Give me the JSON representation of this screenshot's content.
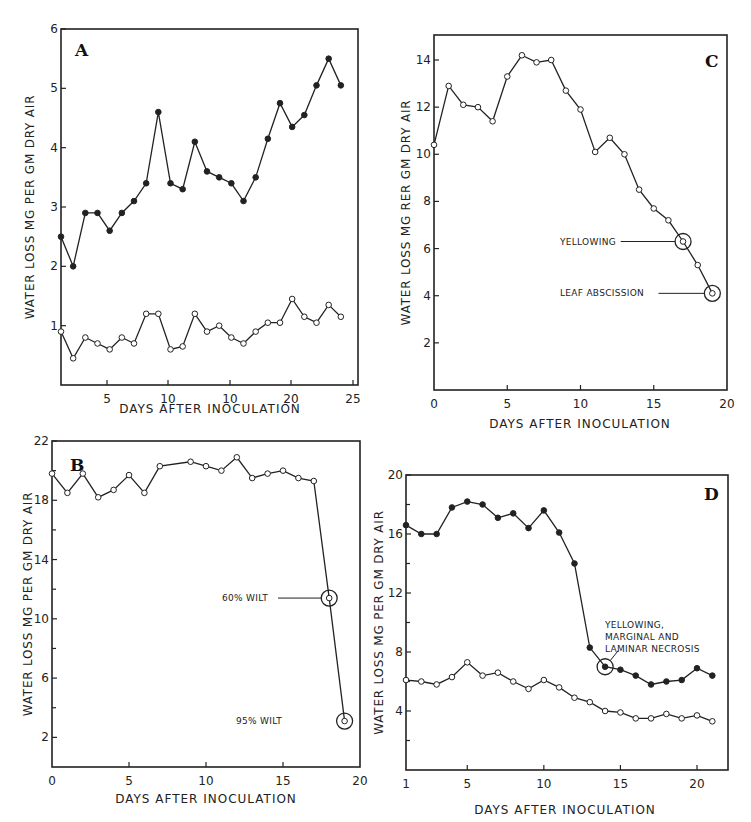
{
  "figure": {
    "panels": {
      "A": {
        "label": "A",
        "xlabel": "DAYS AFTER INOCULATION",
        "ylabel": "WATER LOSS MG PER GM DRY AIR",
        "xticks": [
          "5",
          "10",
          "10",
          "20",
          "25"
        ],
        "yticks": [
          "1",
          "2",
          "3",
          "4",
          "5",
          "6"
        ]
      },
      "B": {
        "label": "B",
        "xlabel": "DAYS AFTER INOCULATION",
        "ylabel": "WATER LOSS MG PER GM DRY AIR",
        "xticks": [
          "0",
          "5",
          "10",
          "15",
          "20"
        ],
        "yticks": [
          "2",
          "6",
          "10",
          "14",
          "18",
          "22"
        ],
        "annotations": [
          "60% WILT",
          "95% WILT"
        ]
      },
      "C": {
        "label": "C",
        "xlabel": "DAYS AFTER INOCULATION",
        "ylabel": "WATER LOSS MG RER GM DRY AIR",
        "xticks": [
          "0",
          "5",
          "10",
          "15",
          "20"
        ],
        "yticks": [
          "2",
          "4",
          "6",
          "8",
          "10",
          "12",
          "14"
        ],
        "annotations": [
          "YELLOWING",
          "LEAF ABSCISSION"
        ]
      },
      "D": {
        "label": "D",
        "xlabel": "DAYS AFTER INOCULATION",
        "ylabel": "WATER LOSS MG PER GM DRY AIR",
        "xticks": [
          "1",
          "5",
          "10",
          "15",
          "20"
        ],
        "yticks": [
          "4",
          "8",
          "12",
          "16",
          "20"
        ],
        "annotations": [
          "YELLOWING,",
          "MARGINAL AND",
          "LAMINAR NECROSIS"
        ]
      }
    }
  },
  "chart_data": [
    {
      "panel": "A",
      "type": "line",
      "title": "A",
      "xlabel": "DAYS AFTER INOCULATION",
      "ylabel": "WATER LOSS MG PER GM DRY AIR",
      "xlim": [
        1,
        25
      ],
      "ylim": [
        0,
        6
      ],
      "grid": false,
      "x_tick_labels": [
        "5",
        "10",
        "10",
        "20",
        "25"
      ],
      "series": [
        {
          "name": "inoculated (closed circles)",
          "marker": "filled",
          "x": [
            1,
            2,
            3,
            4,
            5,
            6,
            7,
            8,
            9,
            10,
            11,
            12,
            13,
            14,
            15,
            16,
            17,
            18,
            19,
            20,
            21,
            22,
            23,
            24
          ],
          "values": [
            2.5,
            2.0,
            2.9,
            2.9,
            2.6,
            2.9,
            3.1,
            3.4,
            4.6,
            3.4,
            3.3,
            4.1,
            3.6,
            3.5,
            3.4,
            3.1,
            3.5,
            4.15,
            4.75,
            4.35,
            4.55,
            5.05,
            5.5,
            5.05
          ]
        },
        {
          "name": "control (open circles)",
          "marker": "open",
          "x": [
            1,
            2,
            3,
            4,
            5,
            6,
            7,
            8,
            9,
            10,
            11,
            12,
            13,
            14,
            15,
            16,
            17,
            18,
            19,
            20,
            21,
            22,
            23,
            24
          ],
          "values": [
            0.9,
            0.45,
            0.8,
            0.7,
            0.6,
            0.8,
            0.7,
            1.2,
            1.2,
            0.6,
            0.65,
            1.2,
            0.9,
            1.0,
            0.8,
            0.7,
            0.9,
            1.05,
            1.05,
            1.45,
            1.15,
            1.05,
            1.35,
            1.15
          ]
        }
      ]
    },
    {
      "panel": "B",
      "type": "line",
      "title": "B",
      "xlabel": "DAYS AFTER INOCULATION",
      "ylabel": "WATER LOSS MG PER GM DRY AIR",
      "xlim": [
        0,
        20
      ],
      "ylim": [
        0,
        22
      ],
      "grid": false,
      "annotations": [
        {
          "text": "60% WILT",
          "x": 18,
          "y": 11.4
        },
        {
          "text": "95% WILT",
          "x": 19,
          "y": 3.1
        }
      ],
      "series": [
        {
          "name": "inoculated",
          "marker": "open",
          "x": [
            0,
            1,
            2,
            3,
            4,
            5,
            6,
            7,
            9,
            10,
            11,
            12,
            13,
            14,
            15,
            16,
            17,
            18,
            19
          ],
          "values": [
            19.8,
            18.5,
            19.8,
            18.2,
            18.7,
            19.7,
            18.5,
            20.3,
            20.6,
            20.3,
            20.0,
            20.9,
            19.5,
            19.8,
            20.0,
            19.5,
            19.3,
            11.4,
            3.1
          ]
        }
      ]
    },
    {
      "panel": "C",
      "type": "line",
      "title": "C",
      "xlabel": "DAYS AFTER INOCULATION",
      "ylabel": "WATER LOSS MG RER GM DRY AIR",
      "xlim": [
        0,
        20
      ],
      "ylim": [
        0,
        15
      ],
      "grid": false,
      "annotations": [
        {
          "text": "YELLOWING",
          "x": 17,
          "y": 6.3
        },
        {
          "text": "LEAF ABSCISSION",
          "x": 19,
          "y": 4.1
        }
      ],
      "series": [
        {
          "name": "inoculated",
          "marker": "open",
          "x": [
            0,
            1,
            2,
            3,
            4,
            5,
            6,
            7,
            8,
            9,
            10,
            11,
            12,
            13,
            14,
            15,
            16,
            17,
            18,
            19
          ],
          "values": [
            10.4,
            12.9,
            12.1,
            12.0,
            11.4,
            13.3,
            14.2,
            13.9,
            14.0,
            12.7,
            11.9,
            10.1,
            10.7,
            10.0,
            8.5,
            7.7,
            7.2,
            6.3,
            5.3,
            4.1
          ]
        }
      ]
    },
    {
      "panel": "D",
      "type": "line",
      "title": "D",
      "xlabel": "DAYS AFTER INOCULATION",
      "ylabel": "WATER LOSS MG PER GM DRY AIR",
      "xlim": [
        1,
        21.4
      ],
      "ylim": [
        0,
        20
      ],
      "grid": false,
      "annotations": [
        {
          "text": "YELLOWING, MARGINAL AND LAMINAR NECROSIS",
          "x": 14,
          "y": 7.0
        }
      ],
      "series": [
        {
          "name": "inoculated (closed circles)",
          "marker": "filled",
          "x": [
            1,
            2,
            3,
            4,
            5,
            6,
            7,
            8,
            9,
            10,
            11,
            12,
            13,
            14,
            15,
            16,
            17,
            18,
            19,
            20,
            21
          ],
          "values": [
            16.6,
            16.0,
            16.0,
            17.8,
            18.2,
            18.0,
            17.1,
            17.4,
            16.4,
            17.6,
            16.1,
            14.0,
            8.3,
            7.0,
            6.8,
            6.4,
            5.8,
            6.0,
            6.1,
            6.9,
            6.4
          ]
        },
        {
          "name": "control (open circles)",
          "marker": "open",
          "x": [
            1,
            2,
            3,
            4,
            5,
            6,
            7,
            8,
            9,
            10,
            11,
            12,
            13,
            14,
            15,
            16,
            17,
            18,
            19,
            20,
            21
          ],
          "values": [
            6.1,
            6.0,
            5.8,
            6.3,
            7.3,
            6.4,
            6.6,
            6.0,
            5.5,
            6.1,
            5.6,
            4.9,
            4.6,
            4.0,
            3.9,
            3.5,
            3.5,
            3.8,
            3.5,
            3.7,
            3.3
          ]
        }
      ]
    }
  ]
}
